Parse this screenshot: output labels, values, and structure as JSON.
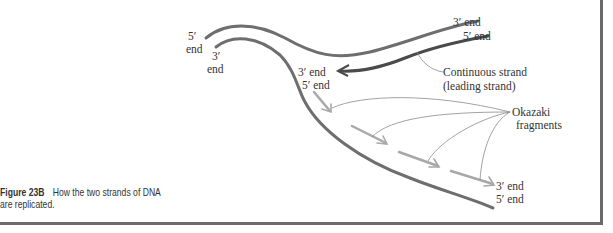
{
  "figure": {
    "label": "Figure 23B",
    "caption": "How the two strands of DNA are replicated."
  },
  "labels": {
    "top_left_5": "5′",
    "top_left_5_end": "end",
    "top_left_3": "3′",
    "top_left_3_end": "end",
    "top_right_3": "3′ end",
    "top_right_5": "5′ end",
    "fork_3": "3′ end",
    "fork_5": "5′ end",
    "continuous_1": "Continuous strand",
    "continuous_2": "(leading strand)",
    "okazaki_1": "Okazaki",
    "okazaki_2": "fragments",
    "bottom_3": "3′ end",
    "bottom_5": "5′ end"
  },
  "colors": {
    "parent_strand": "#6e6e6e",
    "leading_strand": "#4a4a4a",
    "okazaki_fragment": "#a8a8a8",
    "leader_line": "#8a8a8a",
    "frame": "#6a6a6a"
  }
}
